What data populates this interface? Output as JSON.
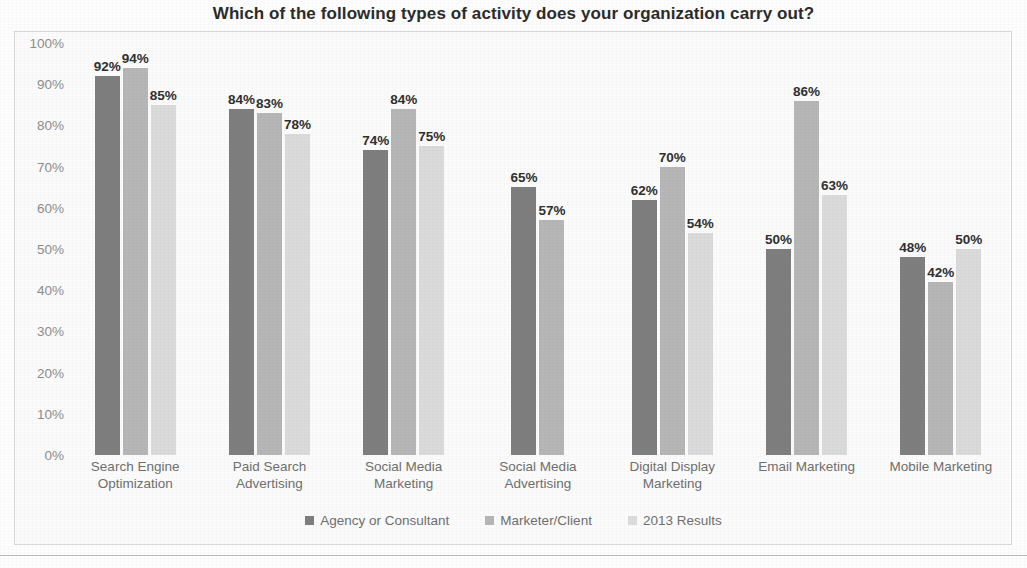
{
  "chart_data": {
    "type": "bar",
    "title": "Which of the following types of activity does your organization carry out?",
    "xlabel": "",
    "ylabel": "",
    "ylim": [
      0,
      100
    ],
    "ytick_labels": [
      "100%",
      "90%",
      "80%",
      "70%",
      "60%",
      "50%",
      "40%",
      "30%",
      "20%",
      "10%",
      "0%"
    ],
    "ytick_values": [
      100,
      90,
      80,
      70,
      60,
      50,
      40,
      30,
      20,
      10,
      0
    ],
    "grid": false,
    "legend_position": "bottom",
    "categories": [
      "Search Engine Optimization",
      "Paid Search Advertising",
      "Social Media Marketing",
      "Social Media Advertising",
      "Digital Display Marketing",
      "Email Marketing",
      "Mobile Marketing"
    ],
    "category_lines": [
      [
        "Search Engine",
        "Optimization"
      ],
      [
        "Paid Search",
        "Advertising"
      ],
      [
        "Social Media",
        "Marketing"
      ],
      [
        "Social Media",
        "Advertising"
      ],
      [
        "Digital Display",
        "Marketing"
      ],
      [
        "Email Marketing",
        ""
      ],
      [
        "Mobile Marketing",
        ""
      ]
    ],
    "series": [
      {
        "name": "Agency or Consultant",
        "color": "#7e7e7e",
        "values": [
          92,
          84,
          74,
          65,
          62,
          50,
          48
        ],
        "labels": [
          "92%",
          "84%",
          "74%",
          "65%",
          "62%",
          "50%",
          "48%"
        ]
      },
      {
        "name": "Marketer/Client",
        "color": "#b6b6b6",
        "values": [
          94,
          83,
          84,
          57,
          70,
          86,
          42
        ],
        "labels": [
          "94%",
          "83%",
          "84%",
          "57%",
          "70%",
          "86%",
          "42%"
        ]
      },
      {
        "name": "2013 Results",
        "color": "#dadada",
        "values": [
          85,
          78,
          75,
          null,
          54,
          63,
          50
        ],
        "labels": [
          "85%",
          "78%",
          "75%",
          "",
          "54%",
          "63%",
          "50%"
        ]
      }
    ]
  }
}
